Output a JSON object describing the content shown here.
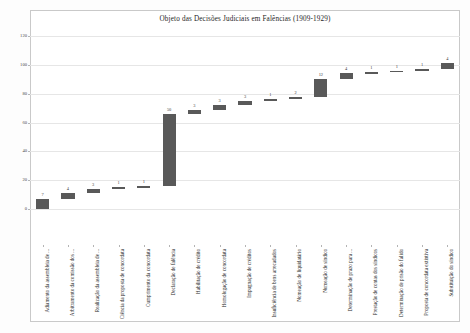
{
  "chart_data": {
    "type": "bar",
    "subtype": "waterfall",
    "title": "Objeto das Decisões Judiciais em Falências (1909-1929)",
    "xlabel": "",
    "ylabel": "",
    "ylim": [
      0,
      120
    ],
    "yticks": [
      0,
      20,
      40,
      60,
      80,
      100,
      120
    ],
    "ytick_labels": [
      "0",
      "20",
      "40",
      "60",
      "80",
      "100",
      "120"
    ],
    "grid": true,
    "legend": false,
    "bar_color": "#595959",
    "categories": [
      "Adiamento da assembleia de ...",
      "Arbitramento da comissão dos ...",
      "Realização da assembleia de ...",
      "Ciência da proposta de concordata",
      "Cumprimento da concordata",
      "Declaração de falência",
      "Habilitação de crédito",
      "Homologação de concordata",
      "Impugnação de créditos",
      "Insuficiência de bens arrecadados",
      "Nomeação de liquidatário",
      "Nomeação de síndico",
      "Determinação de prazo para ...",
      "Prestação de contas dos síndicos",
      "Determinação de prisão do falido",
      "Proposta de concordata extintiva",
      "Substituição do síndico"
    ],
    "values": [
      7,
      4,
      3,
      1,
      1,
      50,
      3,
      3,
      3,
      1,
      2,
      12,
      4,
      1,
      1,
      1,
      4
    ],
    "value_labels": [
      "7",
      "4",
      "3",
      "1",
      "1",
      "50",
      "3",
      "3",
      "3",
      "1",
      "2",
      "12",
      "4",
      "1",
      "1",
      "1",
      "4"
    ],
    "cumulative_start": [
      0,
      7,
      11,
      14,
      15,
      16,
      66,
      69,
      72,
      75,
      76,
      78,
      90,
      94,
      95,
      96,
      97
    ],
    "cumulative_end": [
      7,
      11,
      14,
      15,
      16,
      66,
      69,
      72,
      75,
      76,
      78,
      90,
      94,
      95,
      96,
      97,
      101
    ]
  }
}
